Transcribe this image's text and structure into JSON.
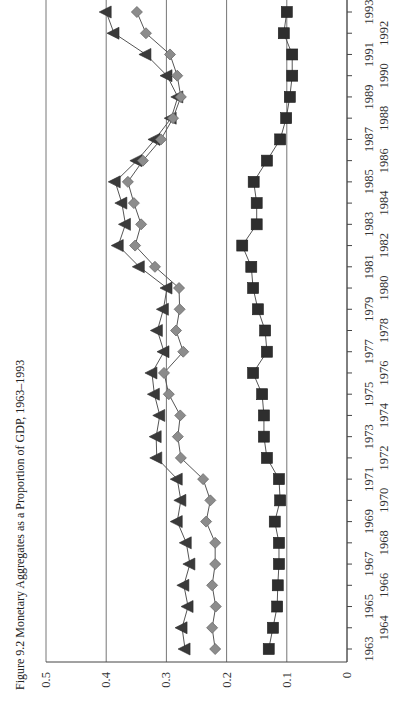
{
  "figure": {
    "label": "Figure 9.2",
    "title": "Monetary Aggregates as a Proportion of GDP, 1963–1993"
  },
  "colors": {
    "triangle_series": "#3a3a3a",
    "diamond_series": "#8c8c8c",
    "square_series": "#2e2e2e",
    "line": "#555555",
    "grid": "#666666",
    "axis": "#444444"
  },
  "chart_data": {
    "type": "line",
    "orientation": "rotated-90",
    "title": "Figure 9.2 Monetary Aggregates as a Proportion of GDP, 1963–1993",
    "xlabel": "",
    "ylabel": "",
    "ylim": [
      0,
      0.5
    ],
    "yticks": [
      0,
      0.1,
      0.2,
      0.3,
      0.4,
      0.5
    ],
    "ytick_labels": [
      "0",
      "0.1",
      "0.2",
      "0.3",
      "0.4",
      "0.5"
    ],
    "grid": true,
    "legend": null,
    "categories": [
      1963,
      1964,
      1965,
      1966,
      1967,
      1968,
      1969,
      1970,
      1971,
      1972,
      1973,
      1974,
      1975,
      1976,
      1977,
      1978,
      1979,
      1980,
      1981,
      1982,
      1983,
      1984,
      1985,
      1986,
      1987,
      1988,
      1989,
      1990,
      1991,
      1992,
      1993
    ],
    "series": [
      {
        "name": "Series A (triangles)",
        "marker": "triangle",
        "values": [
          0.269,
          0.274,
          0.264,
          0.271,
          0.261,
          0.267,
          0.282,
          0.276,
          0.282,
          0.316,
          0.317,
          0.311,
          0.32,
          0.324,
          0.304,
          0.315,
          0.305,
          0.299,
          0.345,
          0.38,
          0.368,
          0.374,
          0.385,
          0.349,
          0.319,
          0.292,
          0.281,
          0.299,
          0.334,
          0.387,
          0.4
        ]
      },
      {
        "name": "Series B (diamonds)",
        "marker": "diamond",
        "values": [
          0.219,
          0.224,
          0.218,
          0.224,
          0.219,
          0.219,
          0.234,
          0.227,
          0.239,
          0.276,
          0.281,
          0.277,
          0.296,
          0.304,
          0.272,
          0.284,
          0.278,
          0.279,
          0.319,
          0.352,
          0.342,
          0.354,
          0.364,
          0.339,
          0.309,
          0.289,
          0.276,
          0.282,
          0.294,
          0.334,
          0.349
        ]
      },
      {
        "name": "Series C (squares)",
        "marker": "square",
        "values": [
          0.13,
          0.123,
          0.116,
          0.115,
          0.113,
          0.113,
          0.12,
          0.111,
          0.113,
          0.133,
          0.138,
          0.138,
          0.141,
          0.156,
          0.133,
          0.136,
          0.148,
          0.156,
          0.159,
          0.174,
          0.15,
          0.15,
          0.155,
          0.133,
          0.111,
          0.101,
          0.095,
          0.091,
          0.091,
          0.105,
          0.1
        ]
      }
    ]
  }
}
